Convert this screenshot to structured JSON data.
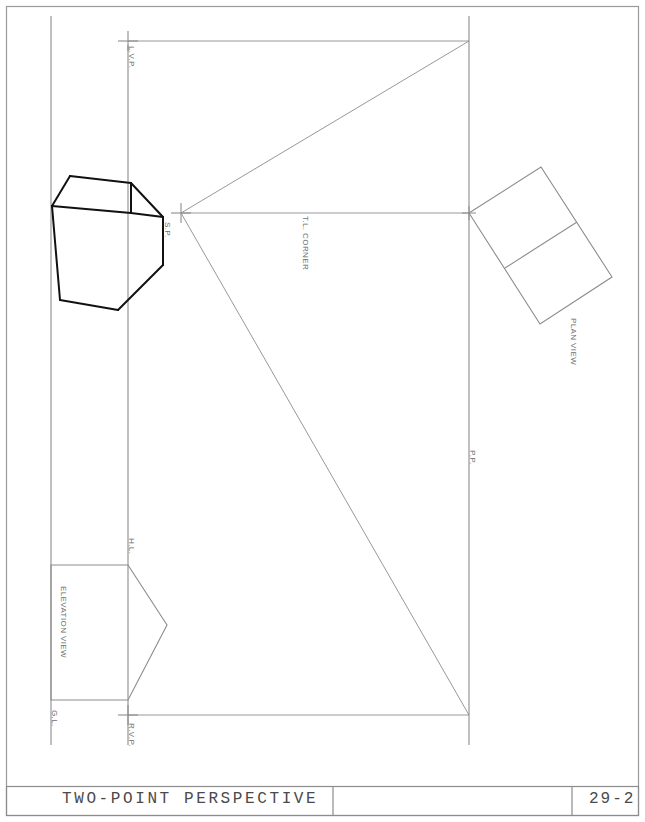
{
  "sheet": {
    "width": 645,
    "height": 822,
    "background": "#ffffff",
    "line_color": "#8c8c8c",
    "heavy_line_color": "#111111",
    "border_color": "#9a9a9a",
    "label_color": "#6d6d6d",
    "title_color": "#4a4a4a"
  },
  "title_block": {
    "drawing_title": "TWO-POINT PERSPECTIVE",
    "middle_field": "",
    "drawing_number": "29-2"
  },
  "labels": {
    "left_vanishing_point": "L.V.P.",
    "station_point": "S.P.",
    "true_length_corner": "T.L. CORNER",
    "plan_view": "PLAN VIEW",
    "picture_plane": "P.P.",
    "horizon_line": "H.L.",
    "elevation_view": "ELEVATION VIEW",
    "ground_line": "G.L.",
    "right_vanishing_point": "R.V.P."
  },
  "geometry": {
    "note": "All coordinates in sheet pixel space (645x822).",
    "border": {
      "x": 6,
      "y": 6,
      "width": 633,
      "height": 810
    },
    "title_block_rows": [
      {
        "x": 6,
        "y": 786,
        "width": 633,
        "height": 30
      }
    ],
    "title_block_dividers_x": [
      333,
      572
    ],
    "picture_plane_line": {
      "x1": 469,
      "y1": 16,
      "x2": 469,
      "y2": 745
    },
    "horizon_line": {
      "x1": 128,
      "y1": 45,
      "x2": 128,
      "y2": 745
    },
    "ground_line": {
      "x1": 51,
      "y1": 16,
      "x2": 51,
      "y2": 745
    },
    "station_point": {
      "x": 181,
      "y": 213
    },
    "left_vanishing_point": {
      "x": 128,
      "y": 41
    },
    "right_vanishing_point": {
      "x": 128,
      "y": 715
    },
    "construction_lines": [
      {
        "name": "lvp-to-pp-top",
        "x1": 128,
        "y1": 41,
        "x2": 469,
        "y2": 41
      },
      {
        "name": "sp-to-top-right",
        "x1": 181,
        "y1": 213,
        "x2": 469,
        "y2": 41
      },
      {
        "name": "sp-to-pp-horizontal",
        "x1": 181,
        "y1": 213,
        "x2": 469,
        "y2": 213
      },
      {
        "name": "sp-to-bottom-right",
        "x1": 181,
        "y1": 213,
        "x2": 469,
        "y2": 715
      },
      {
        "name": "rvp-to-pp-bottom",
        "x1": 128,
        "y1": 715,
        "x2": 469,
        "y2": 715
      }
    ],
    "plan_view_quad": [
      [
        469,
        213
      ],
      [
        541,
        167
      ],
      [
        592,
        250
      ],
      [
        521,
        296
      ]
    ],
    "plan_view_quad_lower": [
      [
        521,
        296
      ],
      [
        592,
        250
      ],
      [
        605,
        272
      ],
      [
        533,
        318
      ]
    ],
    "plan_view_outline": [
      [
        469,
        213
      ],
      [
        541,
        167
      ],
      [
        612,
        277
      ],
      [
        540,
        324
      ]
    ],
    "plan_view_divider": [
      [
        505,
        268
      ],
      [
        577,
        222
      ]
    ],
    "elevation_view_outline": [
      [
        51,
        565
      ],
      [
        128,
        565
      ],
      [
        167,
        625
      ],
      [
        128,
        700
      ],
      [
        51,
        700
      ]
    ],
    "perspective_cube": {
      "front_top_left": [
        70,
        176
      ],
      "front_top_right": [
        130,
        183
      ],
      "left_top": [
        52,
        205
      ],
      "right_top": [
        162,
        216
      ],
      "left_bottom": [
        60,
        300
      ],
      "bottom_mid": [
        118,
        310
      ],
      "right_bottom": [
        162,
        264
      ],
      "vertical_front": [
        [
          130,
          183
        ],
        [
          130,
          235
        ]
      ],
      "edges": [
        [
          [
            70,
            176
          ],
          [
            130,
            183
          ]
        ],
        [
          [
            70,
            176
          ],
          [
            52,
            205
          ]
        ],
        [
          [
            130,
            183
          ],
          [
            162,
            216
          ]
        ],
        [
          [
            52,
            205
          ],
          [
            130,
            212
          ]
        ],
        [
          [
            130,
            212
          ],
          [
            162,
            216
          ]
        ],
        [
          [
            52,
            205
          ],
          [
            60,
            300
          ]
        ],
        [
          [
            60,
            300
          ],
          [
            118,
            310
          ]
        ],
        [
          [
            118,
            310
          ],
          [
            162,
            264
          ]
        ],
        [
          [
            162,
            264
          ],
          [
            162,
            216
          ]
        ],
        [
          [
            130,
            212
          ],
          [
            130,
            183
          ]
        ]
      ]
    }
  }
}
